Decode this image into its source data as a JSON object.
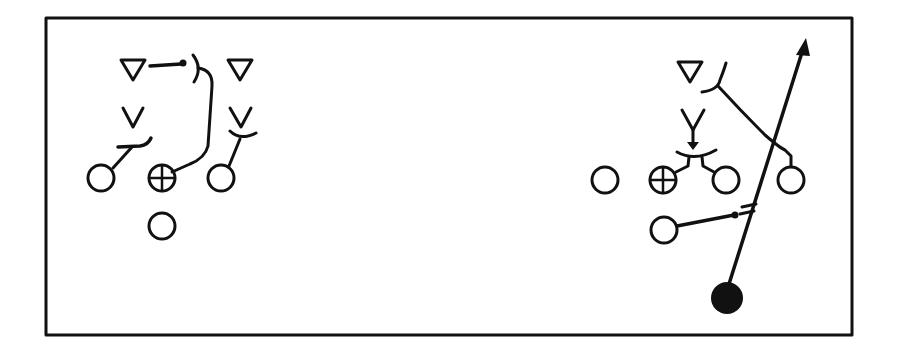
{
  "diagram": {
    "type": "play-diagram",
    "colors": {
      "ink": "#111111",
      "background": "#ffffff"
    },
    "frame": {
      "x": 46,
      "y": 18,
      "width": 806,
      "height": 317
    },
    "formations": [
      {
        "name": "left-formation",
        "defenders_triangle": [
          {
            "x": 133,
            "y": 68
          },
          {
            "x": 240,
            "y": 68
          }
        ],
        "defenders_v": [
          {
            "x": 133,
            "y": 122
          },
          {
            "x": 241,
            "y": 122
          }
        ],
        "offense_circles": [
          {
            "x": 101,
            "y": 178,
            "role": "lineman"
          },
          {
            "x": 162,
            "y": 178,
            "role": "center",
            "crossed": true
          },
          {
            "x": 221,
            "y": 178,
            "role": "lineman"
          },
          {
            "x": 162,
            "y": 226,
            "role": "back"
          }
        ]
      },
      {
        "name": "right-formation",
        "defenders_triangle": [
          {
            "x": 690,
            "y": 70
          }
        ],
        "defenders_v": [
          {
            "x": 693,
            "y": 125
          }
        ],
        "offense_circles": [
          {
            "x": 605,
            "y": 180,
            "role": "lineman"
          },
          {
            "x": 663,
            "y": 180,
            "role": "center",
            "crossed": true
          },
          {
            "x": 726,
            "y": 180,
            "role": "lineman"
          },
          {
            "x": 791,
            "y": 180,
            "role": "lineman"
          },
          {
            "x": 664,
            "y": 230,
            "role": "back"
          }
        ],
        "ball_carrier": {
          "x": 727,
          "y": 298,
          "filled": true
        },
        "route_arrow": {
          "from": {
            "x": 729,
            "y": 284
          },
          "to": {
            "x": 805,
            "y": 40
          }
        }
      }
    ]
  }
}
